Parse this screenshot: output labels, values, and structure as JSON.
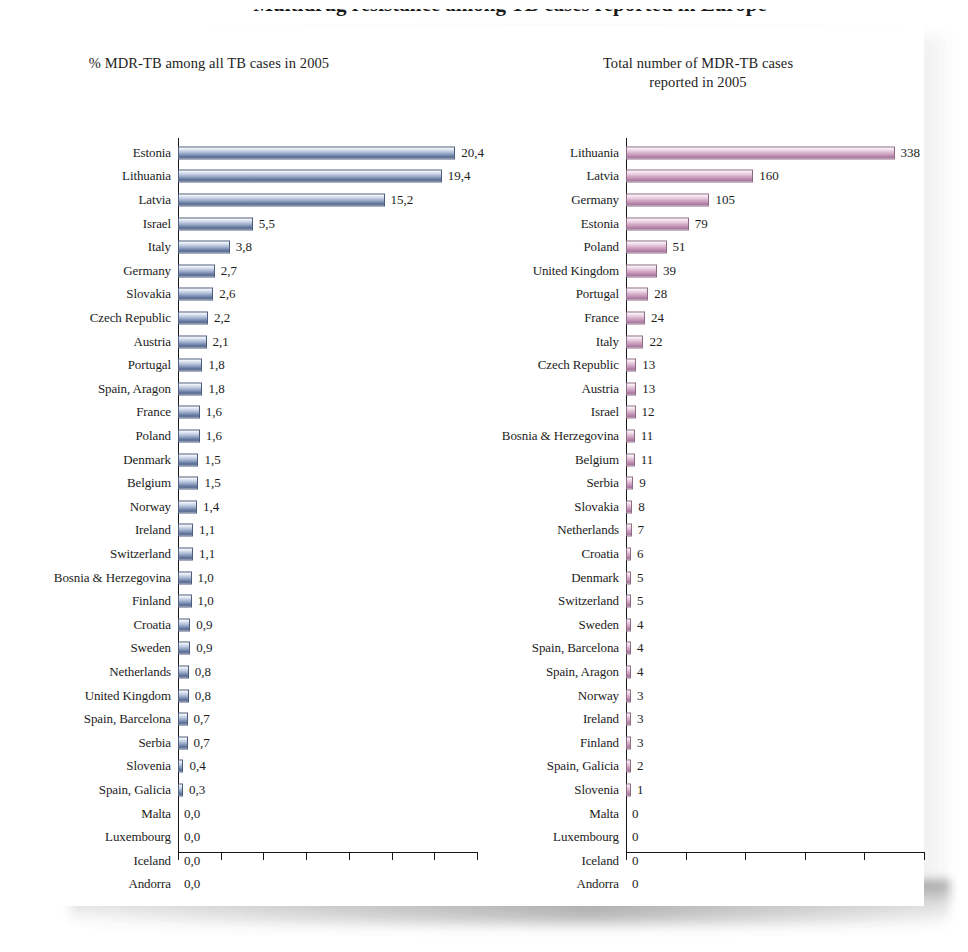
{
  "figure": {
    "clipped_top_title": "Multidrug resistance among TB cases reported in Europe",
    "left_panel": {
      "title": "% MDR-TB among all TB cases in 2005",
      "axis_max": 22,
      "tick_count": 7,
      "bar_color": "#7689ad"
    },
    "right_panel": {
      "title_line1": "Total number of MDR-TB cases",
      "title_line2": "reported in 2005",
      "axis_max": 375,
      "tick_count": 5,
      "bar_color": "#bf8fb2"
    }
  },
  "chart_data": [
    {
      "type": "bar",
      "orientation": "horizontal",
      "title": "% MDR-TB among all TB cases in 2005",
      "xlabel": "",
      "ylabel": "",
      "xlim": [
        0,
        22
      ],
      "grid": false,
      "legend": null,
      "value_format": "comma-decimal",
      "categories": [
        "Estonia",
        "Lithuania",
        "Latvia",
        "Israel",
        "Italy",
        "Germany",
        "Slovakia",
        "Czech Republic",
        "Austria",
        "Portugal",
        "Spain, Aragon",
        "France",
        "Poland",
        "Denmark",
        "Belgium",
        "Norway",
        "Ireland",
        "Switzerland",
        "Bosnia & Herzegovina",
        "Finland",
        "Croatia",
        "Sweden",
        "Netherlands",
        "United Kingdom",
        "Spain, Barcelona",
        "Serbia",
        "Slovenia",
        "Spain, Galicia",
        "Malta",
        "Luxembourg",
        "Iceland",
        "Andorra"
      ],
      "values": [
        20.4,
        19.4,
        15.2,
        5.5,
        3.8,
        2.7,
        2.6,
        2.2,
        2.1,
        1.8,
        1.8,
        1.6,
        1.6,
        1.5,
        1.5,
        1.4,
        1.1,
        1.1,
        1.0,
        1.0,
        0.9,
        0.9,
        0.8,
        0.8,
        0.7,
        0.7,
        0.4,
        0.3,
        0.0,
        0.0,
        0.0,
        0.0
      ],
      "labels": [
        "20,4",
        "19,4",
        "15,2",
        "5,5",
        "3,8",
        "2,7",
        "2,6",
        "2,2",
        "2,1",
        "1,8",
        "1,8",
        "1,6",
        "1,6",
        "1,5",
        "1,5",
        "1,4",
        "1,1",
        "1,1",
        "1,0",
        "1,0",
        "0,9",
        "0,9",
        "0,8",
        "0,8",
        "0,7",
        "0,7",
        "0,4",
        "0,3",
        "0,0",
        "0,0",
        "0,0",
        "0,0"
      ]
    },
    {
      "type": "bar",
      "orientation": "horizontal",
      "title": "Total number of MDR-TB cases reported in 2005",
      "xlabel": "",
      "ylabel": "",
      "xlim": [
        0,
        375
      ],
      "grid": false,
      "legend": null,
      "value_format": "integer",
      "categories": [
        "Lithuania",
        "Latvia",
        "Germany",
        "Estonia",
        "Poland",
        "United Kingdom",
        "Portugal",
        "France",
        "Italy",
        "Czech Republic",
        "Austria",
        "Israel",
        "Bosnia & Herzegovina",
        "Belgium",
        "Serbia",
        "Slovakia",
        "Netherlands",
        "Croatia",
        "Denmark",
        "Switzerland",
        "Sweden",
        "Spain, Barcelona",
        "Spain, Aragon",
        "Norway",
        "Ireland",
        "Finland",
        "Spain, Galicia",
        "Slovenia",
        "Malta",
        "Luxembourg",
        "Iceland",
        "Andorra"
      ],
      "values": [
        338,
        160,
        105,
        79,
        51,
        39,
        28,
        24,
        22,
        13,
        13,
        12,
        11,
        11,
        9,
        8,
        7,
        6,
        5,
        5,
        4,
        4,
        4,
        3,
        3,
        3,
        2,
        1,
        0,
        0,
        0,
        0
      ],
      "labels": [
        "338",
        "160",
        "105",
        "79",
        "51",
        "39",
        "28",
        "24",
        "22",
        "13",
        "13",
        "12",
        "11",
        "11",
        "9",
        "8",
        "7",
        "6",
        "5",
        "5",
        "4",
        "4",
        "4",
        "3",
        "3",
        "3",
        "2",
        "1",
        "0",
        "0",
        "0",
        "0"
      ]
    }
  ]
}
